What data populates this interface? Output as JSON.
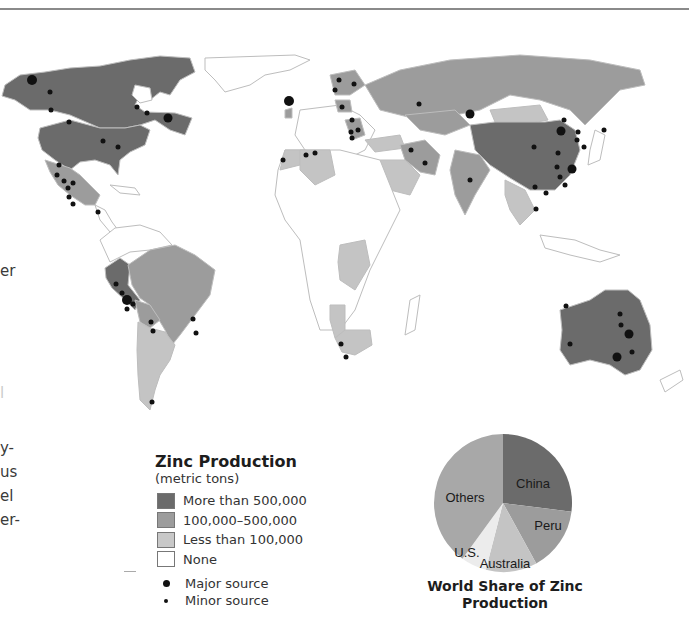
{
  "page": {
    "left_text_fragments": [
      "er",
      "l",
      "y-",
      "us",
      "el",
      "er-"
    ]
  },
  "map": {
    "title": "World Zinc Production Map",
    "colors": {
      "more_than_500000": "#6b6b6b",
      "100000_500000": "#9c9c9c",
      "less_than_100000": "#c4c4c4",
      "none": "#ffffff",
      "border": "#bdbdbd",
      "source_dot": "#111111"
    },
    "regions": [
      {
        "name": "Canada",
        "category": "more_than_500000"
      },
      {
        "name": "United States",
        "category": "more_than_500000"
      },
      {
        "name": "Mexico",
        "category": "100000_500000"
      },
      {
        "name": "Peru",
        "category": "more_than_500000"
      },
      {
        "name": "Brazil",
        "category": "100000_500000"
      },
      {
        "name": "Bolivia",
        "category": "100000_500000"
      },
      {
        "name": "Argentina",
        "category": "less_than_100000"
      },
      {
        "name": "Chile",
        "category": "less_than_100000"
      },
      {
        "name": "Russia",
        "category": "100000_500000"
      },
      {
        "name": "Kazakhstan",
        "category": "100000_500000"
      },
      {
        "name": "China",
        "category": "more_than_500000"
      },
      {
        "name": "India",
        "category": "100000_500000"
      },
      {
        "name": "Iran",
        "category": "100000_500000"
      },
      {
        "name": "Australia",
        "category": "more_than_500000"
      },
      {
        "name": "Ireland",
        "category": "100000_500000"
      },
      {
        "name": "Sweden",
        "category": "100000_500000"
      },
      {
        "name": "Poland",
        "category": "100000_500000"
      },
      {
        "name": "Algeria",
        "category": "less_than_100000"
      },
      {
        "name": "Morocco",
        "category": "less_than_100000"
      },
      {
        "name": "Saudi Arabia",
        "category": "less_than_100000"
      },
      {
        "name": "Turkey",
        "category": "less_than_100000"
      },
      {
        "name": "Mongolia",
        "category": "less_than_100000"
      },
      {
        "name": "DR Congo",
        "category": "less_than_100000"
      },
      {
        "name": "Namibia",
        "category": "less_than_100000"
      },
      {
        "name": "South Africa",
        "category": "less_than_100000"
      },
      {
        "name": "Thailand",
        "category": "less_than_100000"
      },
      {
        "name": "Vietnam",
        "category": "less_than_100000"
      },
      {
        "name": "Japan",
        "category": "less_than_100000"
      },
      {
        "name": "North Korea",
        "category": "less_than_100000"
      }
    ]
  },
  "legend": {
    "title": "Zinc Production",
    "subtitle": "(metric tons)",
    "items": [
      {
        "label": "More than 500,000",
        "color": "#6b6b6b"
      },
      {
        "label": "100,000–500,000",
        "color": "#9c9c9c"
      },
      {
        "label": "Less than 100,000",
        "color": "#c8c8c8"
      },
      {
        "label": "None",
        "color": "#ffffff"
      }
    ],
    "sources": [
      {
        "label": "Major source",
        "type": "major"
      },
      {
        "label": "Minor source",
        "type": "minor"
      }
    ]
  },
  "chart_data": {
    "type": "pie",
    "title": "World Share of Zinc Production",
    "categories": [
      "China",
      "Peru",
      "Australia",
      "U.S.",
      "Others"
    ],
    "values": [
      27,
      15,
      12,
      6,
      40
    ],
    "colors": [
      "#6b6b6b",
      "#9c9c9c",
      "#c4c4c4",
      "#ececec",
      "#a8a8a8"
    ],
    "start_angle_deg": 0,
    "direction": "clockwise",
    "legend_position": "labels-on-slices"
  }
}
